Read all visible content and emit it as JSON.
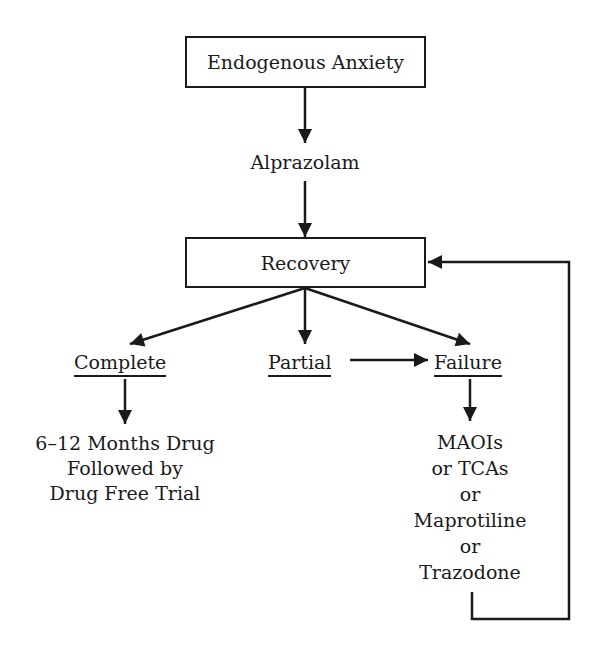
{
  "diagram": {
    "type": "flowchart",
    "nodes": {
      "start": {
        "label": "Endogenous Anxiety",
        "shape": "box"
      },
      "treatment": {
        "label": "Alprazolam",
        "shape": "text"
      },
      "recovery": {
        "label": "Recovery",
        "shape": "box"
      },
      "complete": {
        "label": "Complete",
        "shape": "underlined-text"
      },
      "partial": {
        "label": "Partial",
        "shape": "underlined-text"
      },
      "failure": {
        "label": "Failure",
        "shape": "underlined-text"
      },
      "complete_outcome": {
        "lines": [
          "6–12 Months Drug",
          "Followed by",
          "Drug Free Trial"
        ]
      },
      "failure_outcome": {
        "lines": [
          "MAOIs",
          "or TCAs",
          "or",
          "Maprotiline",
          "or",
          "Trazodone"
        ]
      }
    },
    "edges": [
      {
        "from": "Endogenous Anxiety",
        "to": "Alprazolam"
      },
      {
        "from": "Alprazolam",
        "to": "Recovery"
      },
      {
        "from": "Recovery",
        "to": "Complete"
      },
      {
        "from": "Recovery",
        "to": "Partial"
      },
      {
        "from": "Recovery",
        "to": "Failure"
      },
      {
        "from": "Partial",
        "to": "Failure"
      },
      {
        "from": "Complete",
        "to": "6–12 Months Drug Followed by Drug Free Trial"
      },
      {
        "from": "Failure",
        "to": "MAOIs or TCAs or Maprotiline or Trazodone"
      },
      {
        "from": "MAOIs or TCAs or Maprotiline or Trazodone",
        "to": "Recovery",
        "style": "loop-back"
      }
    ],
    "colors": {
      "ink": "#1a1a1a",
      "background": "#ffffff"
    }
  }
}
